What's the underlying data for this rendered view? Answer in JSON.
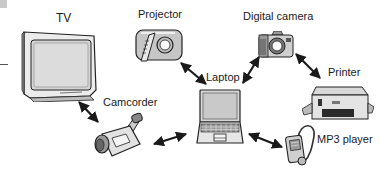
{
  "diagram": {
    "type": "network-connection-diagram",
    "hub": {
      "id": "laptop",
      "label": "Laptop"
    },
    "nodes": [
      {
        "id": "tv",
        "label": "TV"
      },
      {
        "id": "projector",
        "label": "Projector"
      },
      {
        "id": "digital-camera",
        "label": "Digital camera"
      },
      {
        "id": "printer",
        "label": "Printer"
      },
      {
        "id": "camcorder",
        "label": "Camcorder"
      },
      {
        "id": "mp3-player",
        "label": "MP3 player"
      },
      {
        "id": "laptop",
        "label": "Laptop"
      }
    ],
    "edges": [
      {
        "from": "tv",
        "to": "camcorder",
        "style": "double-arrow"
      },
      {
        "from": "camcorder",
        "to": "laptop",
        "style": "double-arrow"
      },
      {
        "from": "projector",
        "to": "laptop",
        "style": "double-arrow"
      },
      {
        "from": "digital-camera",
        "to": "laptop",
        "style": "double-arrow"
      },
      {
        "from": "digital-camera",
        "to": "printer",
        "style": "double-arrow"
      },
      {
        "from": "laptop",
        "to": "mp3-player",
        "style": "double-arrow"
      }
    ]
  },
  "labels": {
    "tv": "TV",
    "projector": "Projector",
    "digital_camera": "Digital camera",
    "printer": "Printer",
    "camcorder": "Camcorder",
    "mp3_player": "MP3 player",
    "laptop": "Laptop"
  },
  "colors": {
    "line": "#222222",
    "fill_light": "#e6e6e6",
    "fill_mid": "#c8c8c8",
    "fill_dark": "#8a8a8a"
  }
}
